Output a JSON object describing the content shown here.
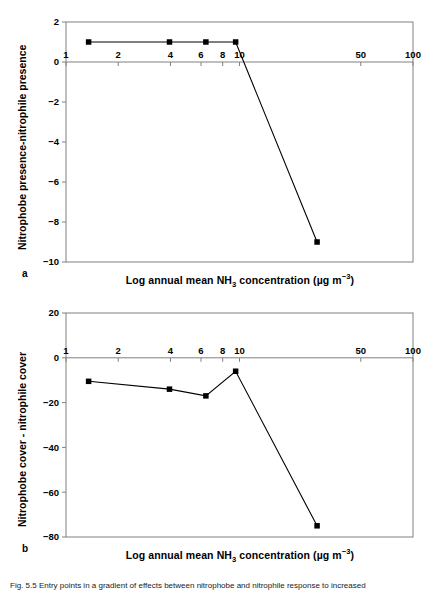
{
  "figure": {
    "caption_prefix": "Fig. 5.5",
    "caption_text": "Fig. 5.5  Entry points in a gradient of effects between nitrophobe and nitrophile response to increased"
  },
  "panel_a": {
    "label": "a",
    "xlabel_parts": {
      "before": "Log annual mean NH",
      "sub": "3",
      "middle": " concentration (µg m",
      "sup": "−3",
      "after": ")"
    },
    "ylabel": "Nitrophobe presence-nitrophile presence"
  },
  "panel_b": {
    "label": "b",
    "xlabel_parts": {
      "before": "Log annual mean NH",
      "sub": "3",
      "middle": " concentration (µg m",
      "sup": "−3",
      "after": ")"
    },
    "ylabel": "Nitrophobe cover - nitrophile cover"
  },
  "chart_data": [
    {
      "type": "line",
      "panel": "a",
      "title": "",
      "xlabel": "Log annual mean NH3 concentration (µg m-3)",
      "ylabel": "Nitrophobe presence-nitrophile presence",
      "xscale": "log",
      "xlim": [
        1,
        100
      ],
      "ylim": [
        -10,
        2
      ],
      "xticks": [
        1,
        2,
        4,
        6,
        8,
        10,
        50,
        100
      ],
      "xticklabels": [
        "1",
        "2",
        "4",
        "6",
        "8",
        "10",
        "50",
        "100"
      ],
      "yticks": [
        2,
        0,
        -2,
        -4,
        -6,
        -8,
        -10
      ],
      "yticklabels": [
        "2",
        "0",
        "−2",
        "−4",
        "−6",
        "−8",
        "−10"
      ],
      "grid": false,
      "legend": "none",
      "marker": "square-filled",
      "x": [
        1.35,
        3.95,
        6.4,
        9.5,
        28
      ],
      "y": [
        1,
        1,
        1,
        1,
        -9
      ]
    },
    {
      "type": "line",
      "panel": "b",
      "title": "",
      "xlabel": "Log annual mean NH3 concentration (µg m-3)",
      "ylabel": "Nitrophobe cover - nitrophile cover",
      "xscale": "log",
      "xlim": [
        1,
        100
      ],
      "ylim": [
        -80,
        20
      ],
      "xticks": [
        1,
        2,
        4,
        6,
        8,
        10,
        50,
        100
      ],
      "xticklabels": [
        "1",
        "2",
        "4",
        "6",
        "8",
        "10",
        "50",
        "100"
      ],
      "yticks": [
        20,
        0,
        -20,
        -40,
        -60,
        -80
      ],
      "yticklabels": [
        "20",
        "0",
        "−20",
        "−40",
        "−60",
        "−80"
      ],
      "grid": false,
      "legend": "none",
      "marker": "square-filled",
      "x": [
        1.35,
        3.95,
        6.4,
        9.5,
        28
      ],
      "y": [
        -10.5,
        -14,
        -17,
        -6,
        -75
      ]
    }
  ],
  "colors": {
    "line": "#000000",
    "marker": "#000000",
    "axis": "#808080",
    "text": "#000000"
  }
}
